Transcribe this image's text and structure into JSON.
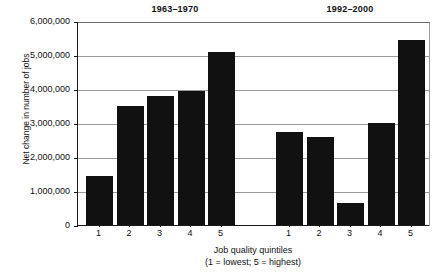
{
  "chart_data": {
    "type": "bar",
    "title": "",
    "xlabel": "Job quality quintiles",
    "xlabel_note": "(1 = lowest; 5 = highest)",
    "ylabel": "Net change in number of jobs",
    "ylim": [
      0,
      6000000
    ],
    "ytick_values": [
      0,
      1000000,
      2000000,
      3000000,
      4000000,
      5000000,
      6000000
    ],
    "ytick_labels": [
      "0",
      "1,000,000",
      "2,000,000",
      "3,000,000",
      "4,000,000",
      "5,000,000",
      "6,000,000"
    ],
    "grid": true,
    "legend": "none",
    "categories": [
      "1",
      "2",
      "3",
      "4",
      "5"
    ],
    "panels": [
      {
        "label": "1963–1970",
        "categories": [
          "1",
          "2",
          "3",
          "4",
          "5"
        ],
        "values": [
          1450000,
          3500000,
          3800000,
          3950000,
          5100000
        ]
      },
      {
        "label": "1992–2000",
        "categories": [
          "1",
          "2",
          "3",
          "4",
          "5"
        ],
        "values": [
          2750000,
          2600000,
          650000,
          3000000,
          5450000
        ]
      }
    ],
    "colors": {
      "bar": "#111111",
      "grid": "#9a9a9a",
      "axis": "#1a1a1a",
      "background": "#ffffff",
      "text": "#111111"
    }
  }
}
